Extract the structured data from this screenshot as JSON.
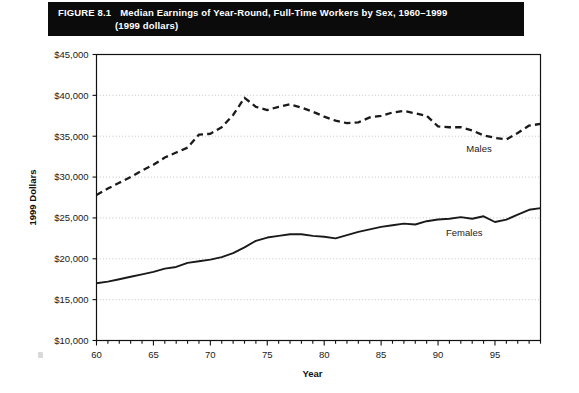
{
  "figure": {
    "number_label": "FIGURE 8.1",
    "title_line1": "Median Earnings of Year-Round, Full-Time Workers by Sex, 1960–1999",
    "title_line2": "(1999 dollars)",
    "banner_bg": "#0b0b0b",
    "banner_fg": "#ffffff"
  },
  "chart_data": {
    "type": "line",
    "title": "Median Earnings of Year-Round, Full-Time Workers by Sex, 1960–1999 (1999 dollars)",
    "xlabel": "Year",
    "ylabel": "1999 Dollars",
    "xlim": [
      60,
      99
    ],
    "ylim": [
      10000,
      45000
    ],
    "grid": true,
    "grid_style": "dotted-horizontal",
    "legend": "inline-labels",
    "ytick_values": [
      10000,
      15000,
      20000,
      25000,
      30000,
      35000,
      40000,
      45000
    ],
    "ytick_labels": [
      "$10,000",
      "$15,000",
      "$20,000",
      "$25,000",
      "$30,000",
      "$35,000",
      "$40,000",
      "$45,000"
    ],
    "xtick_values": [
      60,
      65,
      70,
      75,
      80,
      85,
      90,
      95
    ],
    "xtick_labels": [
      "60",
      "65",
      "70",
      "75",
      "80",
      "85",
      "90",
      "95"
    ],
    "xtick_minor_step": 1,
    "x": [
      60,
      61,
      62,
      63,
      64,
      65,
      66,
      67,
      68,
      69,
      70,
      71,
      72,
      73,
      74,
      75,
      76,
      77,
      78,
      79,
      80,
      81,
      82,
      83,
      84,
      85,
      86,
      87,
      88,
      89,
      90,
      91,
      92,
      93,
      94,
      95,
      96,
      97,
      98,
      99
    ],
    "series": [
      {
        "name": "Males",
        "label": "Males",
        "style": "dashed",
        "color": "#1a1a1a",
        "label_x": 93.6,
        "label_y": 33100,
        "values": [
          27800,
          28600,
          29300,
          30000,
          30800,
          31500,
          32400,
          33000,
          33600,
          35200,
          35300,
          36100,
          37600,
          39700,
          38600,
          38200,
          38600,
          38900,
          38500,
          38000,
          37400,
          36900,
          36600,
          36700,
          37300,
          37500,
          37900,
          38100,
          37800,
          37500,
          36200,
          36100,
          36100,
          35700,
          35100,
          34800,
          34600,
          35400,
          36300,
          36500
        ]
      },
      {
        "name": "Females",
        "label": "Females",
        "style": "solid",
        "color": "#1a1a1a",
        "label_x": 92.3,
        "label_y": 22800,
        "values": [
          17000,
          17200,
          17500,
          17800,
          18100,
          18400,
          18800,
          19000,
          19500,
          19700,
          19900,
          20200,
          20700,
          21400,
          22200,
          22600,
          22800,
          23000,
          23000,
          22800,
          22700,
          22500,
          22900,
          23300,
          23600,
          23900,
          24100,
          24300,
          24200,
          24600,
          24800,
          24900,
          25100,
          24900,
          25200,
          24500,
          24800,
          25400,
          26000,
          26200
        ]
      }
    ]
  }
}
